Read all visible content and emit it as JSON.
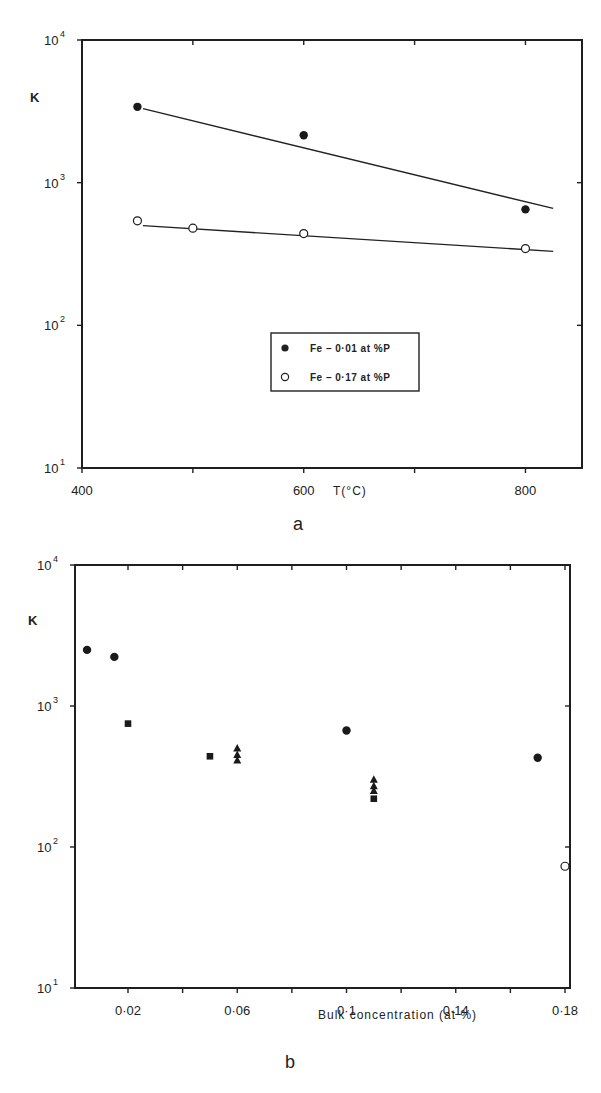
{
  "chart_data": [
    {
      "id": "a",
      "type": "scatter",
      "caption": "a",
      "title": "",
      "xlabel": "T(°C)",
      "ylabel": "K",
      "xscale": "linear",
      "yscale": "log",
      "xlim": [
        400,
        851
      ],
      "ylim": [
        10,
        10000
      ],
      "x_ticks": [
        400,
        500,
        600,
        700,
        800
      ],
      "x_tick_labels": [
        "400",
        "",
        "600",
        "",
        "800"
      ],
      "y_ticks": [
        10,
        100,
        1000,
        10000
      ],
      "y_tick_labels": [
        {
          "base": "10",
          "exp": "1"
        },
        {
          "base": "10",
          "exp": "2"
        },
        {
          "base": "10",
          "exp": "3"
        },
        {
          "base": "10",
          "exp": "4"
        }
      ],
      "grid": false,
      "legend": {
        "position": "center-right",
        "entries": [
          {
            "marker": "filled-circle",
            "label": "Fe – 0·01 at %P"
          },
          {
            "marker": "open-circle",
            "label": "Fe – 0·17 at %P"
          }
        ]
      },
      "series": [
        {
          "name": "Fe – 0·01 at %P",
          "marker": "filled-circle",
          "x": [
            450,
            600,
            800
          ],
          "y": [
            3400,
            2150,
            650
          ],
          "fit_line": {
            "x": [
              455,
              825
            ],
            "y": [
              3300,
              660
            ]
          }
        },
        {
          "name": "Fe – 0·17 at %P",
          "marker": "open-circle",
          "x": [
            450,
            500,
            600,
            800
          ],
          "y": [
            540,
            480,
            440,
            345
          ],
          "fit_line": {
            "x": [
              455,
              825
            ],
            "y": [
              500,
              330
            ]
          }
        }
      ]
    },
    {
      "id": "b",
      "type": "scatter",
      "caption": "b",
      "title": "",
      "xlabel": "Bulk  concentration  (at %)",
      "ylabel": "K",
      "xscale": "linear",
      "yscale": "log",
      "xlim": [
        0.0005,
        0.18
      ],
      "ylim": [
        10,
        10000
      ],
      "x_ticks": [
        0.02,
        0.04,
        0.06,
        0.08,
        0.1,
        0.12,
        0.14,
        0.16,
        0.18
      ],
      "x_tick_labels": [
        "0·02",
        "",
        "0·06",
        "",
        "0·1",
        "",
        "0·14",
        "",
        "0·18"
      ],
      "y_ticks": [
        10,
        100,
        1000,
        10000
      ],
      "y_tick_labels": [
        {
          "base": "10",
          "exp": "1"
        },
        {
          "base": "10",
          "exp": "2"
        },
        {
          "base": "10",
          "exp": "3"
        },
        {
          "base": "10",
          "exp": "4"
        }
      ],
      "grid": false,
      "legend": null,
      "series": [
        {
          "name": "filled circles",
          "marker": "filled-circle",
          "x": [
            0.005,
            0.015,
            0.1,
            0.17
          ],
          "y": [
            2500,
            2230,
            670,
            430
          ]
        },
        {
          "name": "filled squares",
          "marker": "filled-square",
          "x": [
            0.02,
            0.05,
            0.11
          ],
          "y": [
            750,
            440,
            220
          ]
        },
        {
          "name": "filled triangles",
          "marker": "filled-triangle",
          "x": [
            0.06,
            0.06,
            0.06,
            0.11,
            0.11,
            0.11
          ],
          "y": [
            500,
            450,
            410,
            300,
            270,
            250
          ]
        },
        {
          "name": "open circle",
          "marker": "open-circle",
          "x": [
            0.18
          ],
          "y": [
            73
          ]
        }
      ]
    }
  ]
}
